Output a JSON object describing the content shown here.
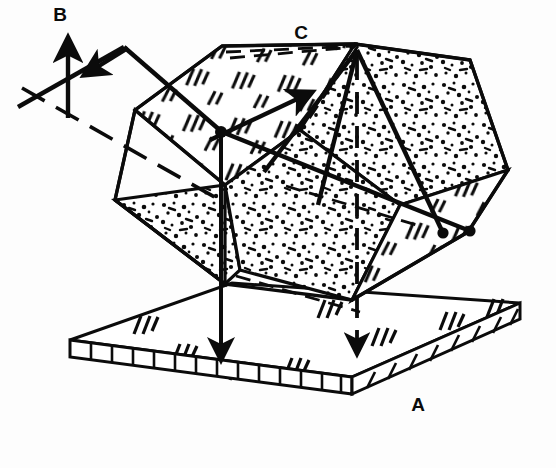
{
  "figure": {
    "kind": "technical-line-drawing",
    "background_color": "#fdfdfd",
    "ink_color": "#0b0b0b",
    "width": 556,
    "height": 468
  },
  "labels": {
    "a": "A",
    "b": "B",
    "c": "C"
  },
  "label_positions": {
    "a": {
      "x": 410,
      "y": 411
    },
    "b": {
      "x": 60,
      "y": 21
    },
    "c": {
      "x": 292,
      "y": 39
    }
  },
  "annotations": {
    "base_plate_name": "base plate A",
    "outgoing_ray_name": "ray B",
    "apex_name": "apex C"
  },
  "geometry": {
    "base_plate": {
      "top_face": "M 70,340 L 232,283 L 520,303 L 352,377 Z",
      "front_edge_left": "M 70,340 L 70,356 L 352,393 L 352,377 Z",
      "front_edge_right": "M 352,377 L 352,393 L 520,318 L 520,303 Z",
      "ladder_segments_left": 13,
      "ladder_segments_right": 8
    },
    "block_outline": "M 115,200 L 135,110 L 222,46 L 355,44 L 470,60 L 508,170 L 468,232 L 352,300 L 225,283 L 115,200 Z",
    "faces": [
      {
        "id": "top-left-face",
        "texture": "ticks",
        "path": "M 135,110 L 222,46 L 355,44 L 300,130 L 225,185 Z"
      },
      {
        "id": "top-right-face",
        "texture": "stipple",
        "path": "M 355,44 L 470,60 L 508,170 L 400,205 L 300,130 Z"
      },
      {
        "id": "left-face",
        "texture": "stipple",
        "path": "M 115,200 L 225,185 L 240,270 L 225,283 L 115,200 Z"
      },
      {
        "id": "center-face",
        "texture": "stipple",
        "path": "M 225,185 L 300,130 L 400,205 L 352,300 L 240,270 Z"
      },
      {
        "id": "right-face",
        "texture": "ticks",
        "path": "M 400,205 L 508,170 L 468,232 L 352,300 Z"
      }
    ]
  },
  "rays": [
    {
      "id": "incoming-ray",
      "description": "ray entering block from lower-left toward apex"
    },
    {
      "id": "reflected-ray-b",
      "description": "vertical arrow pointing up labeled B"
    },
    {
      "id": "exit-ray",
      "description": "arrow leaving toward upper-left bend point"
    },
    {
      "id": "apex-ray-left",
      "description": "ray from apex C down-left to marker dot"
    },
    {
      "id": "apex-ray-right",
      "description": "ray from apex C down-right to marker dot"
    },
    {
      "id": "vertical-drop-left",
      "description": "solid vertical line with arrowhead at base"
    },
    {
      "id": "vertical-drop-center",
      "description": "dashed vertical line from C with arrowhead at base"
    }
  ],
  "markers": [
    {
      "id": "node-left",
      "x": 220,
      "y": 130
    },
    {
      "id": "node-mid-right",
      "x": 443,
      "y": 233
    },
    {
      "id": "node-right",
      "x": 470,
      "y": 231
    }
  ]
}
